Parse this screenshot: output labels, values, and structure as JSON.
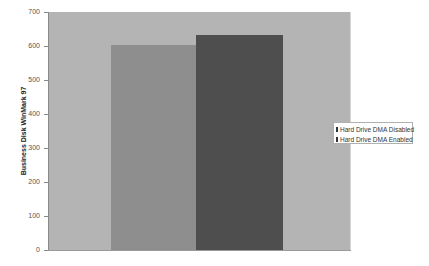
{
  "chart_data": {
    "type": "bar",
    "title": "",
    "xlabel": "",
    "ylabel": "Business Disk WinMark 97",
    "ylim": [
      0,
      700
    ],
    "yticks": [
      0,
      100,
      200,
      300,
      400,
      500,
      600,
      700
    ],
    "grid": false,
    "legend_position": "right",
    "categories": [
      ""
    ],
    "series": [
      {
        "name": "Hard Drive DMA Disabled",
        "values": [
          603
        ],
        "color": "#8e8e8e"
      },
      {
        "name": "Hard Drive DMA Enabled",
        "values": [
          632
        ],
        "color": "#4e4e4e"
      }
    ],
    "plot_background": "#b4b4b4"
  },
  "labels": {
    "ylabel": "Business Disk WinMark 97",
    "ticks": [
      "0",
      "100",
      "200",
      "300",
      "400",
      "500",
      "600",
      "700"
    ],
    "legend": [
      "Hard Drive DMA Disabled",
      "Hard Drive DMA Enabled"
    ]
  }
}
